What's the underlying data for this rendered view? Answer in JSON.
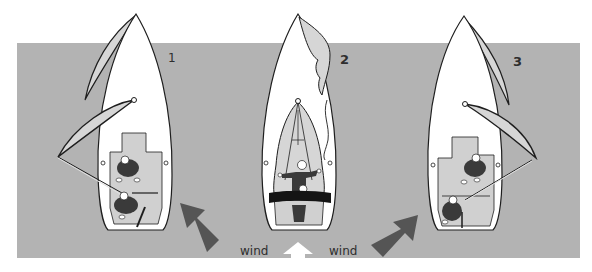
{
  "diagram": {
    "background_color": "#ffffff",
    "water_color": "#b3b3b3",
    "hull_color": "#ffffff",
    "cockpit_color": "#d0d0d0",
    "sail_color": "#d6d6d6",
    "outline_color": "#1e1e1e",
    "wind_arrow_color": "#555555",
    "wind_arrow_center_color": "#ffffff",
    "steps": [
      {
        "number": "1",
        "description": "Spinnaker set on one side, pole to windward"
      },
      {
        "number": "2",
        "description": "Spinnaker being lowered into the boat"
      },
      {
        "number": "3",
        "description": "Spinnaker set on the other side, pole to windward"
      }
    ],
    "wind_labels": [
      "wind",
      "wind"
    ],
    "wind_arrows": [
      {
        "position": "left",
        "direction": "up-left",
        "color": "#555555"
      },
      {
        "position": "center",
        "direction": "up",
        "color": "#ffffff"
      },
      {
        "position": "right",
        "direction": "up-right",
        "color": "#555555"
      }
    ]
  }
}
